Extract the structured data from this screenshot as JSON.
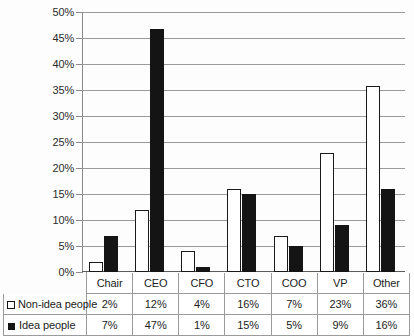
{
  "chart_data": {
    "type": "bar",
    "title": "",
    "subtitle": "",
    "xlabel": "",
    "ylabel": "",
    "categories": [
      "Chair",
      "CEO",
      "CFO",
      "CTO",
      "COO",
      "VP",
      "Other"
    ],
    "series": [
      {
        "name": "Non-idea people",
        "swatch": "open-square",
        "color": "#ffffff",
        "border_color": "#1a1a1a",
        "values": [
          2,
          12,
          4,
          16,
          7,
          23,
          36
        ],
        "labels": [
          "2%",
          "12%",
          "4%",
          "16%",
          "7%",
          "23%",
          "36%"
        ]
      },
      {
        "name": "Idea people",
        "swatch": "filled-square",
        "color": "#141414",
        "border_color": "#141414",
        "values": [
          7,
          47,
          1,
          15,
          5,
          9,
          16
        ],
        "labels": [
          "7%",
          "47%",
          "1%",
          "15%",
          "5%",
          "9%",
          "16%"
        ]
      }
    ],
    "ylim": [
      0,
      50
    ],
    "ytick_step": 5,
    "ytick_labels": [
      "50%",
      "45%",
      "40%",
      "35%",
      "30%",
      "25%",
      "20%",
      "15%",
      "10%",
      "5%",
      "0%"
    ],
    "ytick_values": [
      50,
      45,
      40,
      35,
      30,
      25,
      20,
      15,
      10,
      5,
      0
    ],
    "grid": true,
    "grid_axis": "y",
    "legend_position": "data-table-left",
    "value_suffix": "%",
    "data_table_visible": true
  },
  "data_table": {
    "header_row": [
      "",
      "Chair",
      "CEO",
      "CFO",
      "CTO",
      "COO",
      "VP",
      "Other"
    ],
    "rows": [
      {
        "label": "Non-idea people",
        "swatch": "open-square",
        "cells": [
          "2%",
          "12%",
          "4%",
          "16%",
          "7%",
          "23%",
          "36%"
        ]
      },
      {
        "label": "Idea people",
        "swatch": "filled-square",
        "cells": [
          "7%",
          "47%",
          "1%",
          "15%",
          "5%",
          "9%",
          "16%"
        ]
      }
    ]
  },
  "colors": {
    "background": "#fdfdfd",
    "gridline": "#9a9a9a",
    "axis": "#8a8a8a",
    "baseline": "#5c5c5c",
    "text": "#1c1c1c",
    "series_nonidea": "#ffffff",
    "series_idea": "#141414"
  }
}
